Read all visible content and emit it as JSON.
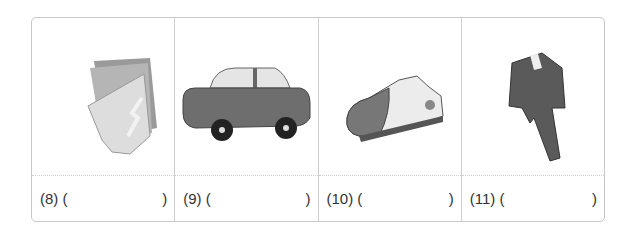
{
  "items": [
    {
      "label": "(8) (",
      "close": ")",
      "icon": "newspaper-icon"
    },
    {
      "label": "(9) (",
      "close": ")",
      "icon": "car-icon"
    },
    {
      "label": "(10) (",
      "close": ")",
      "icon": "sneaker-icon"
    },
    {
      "label": "(11) (",
      "close": ")",
      "icon": "suit-icon"
    }
  ]
}
